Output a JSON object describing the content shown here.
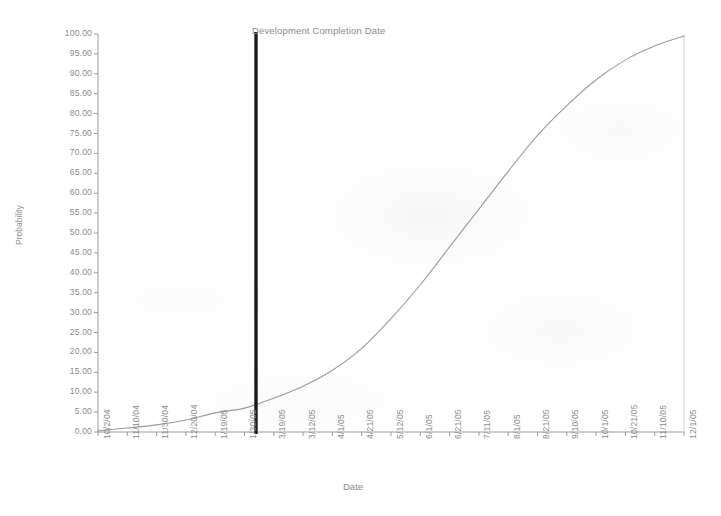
{
  "chart_data": {
    "type": "line",
    "title": "",
    "xlabel": "Date",
    "ylabel": "Probability",
    "grid": false,
    "legend": "none",
    "ylim": [
      0,
      100
    ],
    "yticks": [
      "0.00",
      "5.00",
      "10.00",
      "15.00",
      "20.00",
      "25.00",
      "30.00",
      "35.00",
      "40.00",
      "45.00",
      "50.00",
      "55.00",
      "60.00",
      "65.00",
      "70.00",
      "75.00",
      "80.00",
      "85.00",
      "90.00",
      "95.00",
      "100.00"
    ],
    "ytick_values": [
      0,
      5,
      10,
      15,
      20,
      25,
      30,
      35,
      40,
      45,
      50,
      55,
      60,
      65,
      70,
      75,
      80,
      85,
      90,
      95,
      100
    ],
    "xticks": [
      "10/2/04",
      "11/10/04",
      "11/30/04",
      "12/20/04",
      "1/19/05",
      "1/30/05",
      "3/19/05",
      "3/12/05",
      "4/1/05",
      "4/21/05",
      "5/12/05",
      "6/1/05",
      "6/21/05",
      "7/11/05",
      "8/1/05",
      "8/21/05",
      "9/10/05",
      "10/1/05",
      "10/21/05",
      "11/10/05",
      "12/1/05"
    ],
    "series": [
      {
        "name": "Cumulative Probability",
        "x": [
          "10/2/04",
          "11/10/04",
          "11/30/04",
          "12/20/04",
          "1/19/05",
          "1/30/05",
          "3/19/05",
          "3/12/05",
          "4/1/05",
          "4/21/05",
          "5/12/05",
          "6/1/05",
          "6/21/05",
          "7/11/05",
          "8/1/05",
          "8/21/05",
          "9/10/05",
          "10/1/05",
          "10/21/05",
          "11/10/05",
          "12/1/05"
        ],
        "values": [
          0.3,
          1.0,
          1.8,
          3.0,
          4.8,
          6.0,
          8.5,
          11.5,
          15.5,
          21.0,
          28.5,
          37.0,
          46.5,
          56.0,
          65.5,
          74.5,
          82.0,
          88.5,
          93.5,
          97.0,
          99.5
        ]
      }
    ],
    "annotations": [
      {
        "name": "development-completion-date",
        "label": "Development Completion Date",
        "x": "2/18/05",
        "type": "vertical-line",
        "value_at_line": 11.5,
        "color": "#1a1a1a"
      }
    ],
    "colors": {
      "curve": "#9a9a9a",
      "axis": "#999999",
      "marker_line": "#1a1a1a",
      "text": "#8a8a8a",
      "background": "#ffffff"
    }
  },
  "axes": {
    "y_title": "Probability",
    "x_title": "Date"
  },
  "marker": {
    "label": "Development Completion Date"
  }
}
